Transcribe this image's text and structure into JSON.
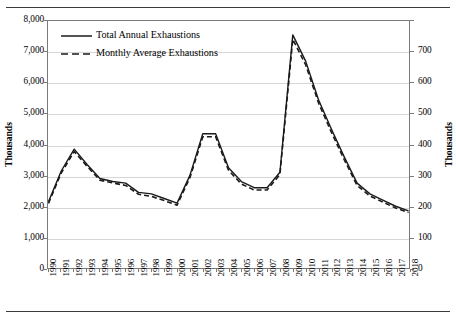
{
  "chart_data": {
    "type": "line",
    "title": "",
    "xlabel": "",
    "ylabel": "Thousands",
    "ylabel_secondary": "Thousands",
    "grid": true,
    "legend_position": "top-left",
    "x": [
      1990,
      1991,
      1992,
      1993,
      1994,
      1995,
      1996,
      1997,
      1998,
      1999,
      2000,
      2001,
      2002,
      2003,
      2004,
      2005,
      2006,
      2007,
      2008,
      2009,
      2010,
      2011,
      2012,
      2013,
      2014,
      2015,
      2016,
      2017,
      2018
    ],
    "categories": [
      "1990",
      "1991",
      "1992",
      "1993",
      "1994",
      "1995",
      "1996",
      "1997",
      "1998",
      "1999",
      "2000",
      "2001",
      "2002",
      "2003",
      "2004",
      "2005",
      "2006",
      "2007",
      "2008",
      "2009",
      "2010",
      "2011",
      "2012",
      "2013",
      "2014",
      "2015",
      "2016",
      "2017",
      "2018"
    ],
    "ylim": [
      0,
      8000
    ],
    "yticks": [
      "0",
      "1,000",
      "2,000",
      "3,000",
      "4,000",
      "5,000",
      "6,000",
      "7,000",
      "8,000"
    ],
    "ylim_secondary": [
      0,
      700
    ],
    "yticks_secondary": [
      "0",
      "100",
      "200",
      "300",
      "400",
      "500",
      "600",
      "700"
    ],
    "series": [
      {
        "name": "Total Annual Exhaustions",
        "style": "solid",
        "axis": "left",
        "color": "#1a1a1a",
        "values": [
          2150,
          3150,
          3850,
          3350,
          2900,
          2800,
          2750,
          2450,
          2400,
          2250,
          2100,
          3000,
          4350,
          4350,
          3250,
          2800,
          2600,
          2600,
          3100,
          7550,
          6700,
          5450,
          4500,
          3600,
          2750,
          2400,
          2200,
          2000,
          1850
        ]
      },
      {
        "name": "Monthly Average Exhaustions",
        "style": "dashed",
        "axis": "right",
        "color": "#1a1a1a",
        "values": [
          183,
          270,
          330,
          288,
          249,
          241,
          234,
          209,
          203,
          191,
          178,
          256,
          372,
          372,
          277,
          238,
          221,
          221,
          265,
          648,
          576,
          468,
          385,
          307,
          234,
          204,
          187,
          170,
          157
        ]
      }
    ]
  },
  "legend": {
    "items": [
      {
        "label": "Total Annual Exhaustions",
        "style": "solid"
      },
      {
        "label": "Monthly Average Exhaustions",
        "style": "dashed"
      }
    ]
  },
  "axes": {
    "left_title": "Thousands",
    "right_title": "Thousands"
  }
}
